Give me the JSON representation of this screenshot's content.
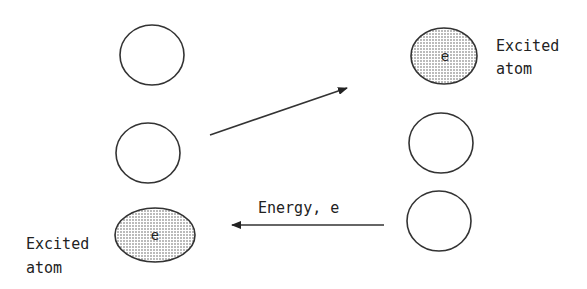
{
  "diagram": {
    "colors": {
      "stroke": "#333333",
      "shade": "#bdbdbd",
      "background": "#ffffff"
    },
    "left_column": [
      {
        "id": "left-top",
        "state": "ground",
        "label": ""
      },
      {
        "id": "left-middle",
        "state": "ground",
        "label": ""
      },
      {
        "id": "left-bottom",
        "state": "excited",
        "label": "e"
      }
    ],
    "right_column": [
      {
        "id": "right-top",
        "state": "excited",
        "label": "e"
      },
      {
        "id": "right-middle",
        "state": "ground",
        "label": ""
      },
      {
        "id": "right-bottom",
        "state": "ground",
        "label": ""
      }
    ],
    "excited_label_line1": "Excited",
    "excited_label_line2": "atom",
    "left_excited_label_line1": "Excited",
    "left_excited_label_line2": "atom",
    "energy_label": "Energy, e",
    "top_electron": "e",
    "bottom_electron": "e"
  }
}
